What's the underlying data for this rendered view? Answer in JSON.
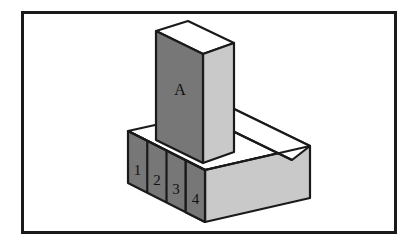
{
  "figure": {
    "canvas": {
      "width": 418,
      "height": 249,
      "background": "#ffffff"
    },
    "frame": {
      "name": "figure-border",
      "x": 21,
      "y": 11,
      "width": 376,
      "height": 223,
      "stroke": "#1a1a1a",
      "stroke_width": 3,
      "fill": "#ffffff"
    },
    "palette": {
      "front_face_dark": "#777777",
      "side_face_light": "#c9c9c9",
      "top_face_white": "#ffffff",
      "outline": "#1a1a1a",
      "label_text": "#111111"
    },
    "labels": {
      "tower": "A",
      "cells": [
        "1",
        "2",
        "3",
        "4"
      ]
    },
    "parts": [
      {
        "name": "vertical-tower-block",
        "label": "A",
        "faces": [
          "top",
          "front",
          "right"
        ],
        "front_fill": "#777777",
        "right_fill": "#c9c9c9",
        "top_fill": "#ffffff"
      },
      {
        "name": "base-slab",
        "faces": [
          "top",
          "front",
          "right"
        ],
        "front_fill": "#777777",
        "right_fill": "#c9c9c9",
        "top_fill": "#ffffff",
        "front_cells": 4
      }
    ]
  }
}
